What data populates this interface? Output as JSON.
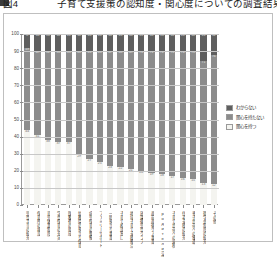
{
  "title": {
    "marker": "figure-bullet",
    "text": "図4　　　　子育て支援策の認知度・関心度についての調査結果（％）"
  },
  "legend": {
    "position": "right",
    "items": [
      {
        "label": "わからない",
        "color": "#5f5f5f"
      },
      {
        "label": "関心を持たない",
        "color": "#8c8c8c"
      },
      {
        "label": "関心を持つ",
        "color": "#f4f4f0"
      }
    ]
  },
  "axes": {
    "y_ticks": [
      "0",
      "10",
      "20",
      "30",
      "40",
      "50",
      "60",
      "70",
      "80",
      "90",
      "100"
    ],
    "y_min": 0,
    "y_max": 100,
    "y_step": 10,
    "grid": true
  },
  "colors": {
    "series_dark": "#5f5f5f",
    "series_mid": "#8c8c8c",
    "series_light": "#f4f4f0",
    "gridline": "#c8c8c8",
    "axis": "#9a9a9a",
    "frame": "#bfbfbf",
    "background": "#ffffff",
    "text": "#3a3a3a"
  },
  "chart_data": {
    "type": "bar",
    "stacked": true,
    "stack_total": 100,
    "orientation": "vertical",
    "xlabel": "",
    "ylabel": "",
    "ylim": [
      0,
      100
    ],
    "grid": true,
    "legend_position": "right",
    "categories": [
      "児童手当の拡充",
      "保育所の増設",
      "育児休業制度",
      "学童保育の充実",
      "医療費の助成",
      "幼稚園の預かり保育",
      "病児保育の整備",
      "ファミリーサポート",
      "一時預かり事業",
      "子育て相談窓口",
      "地域子育て支援拠点",
      "放課後児童クラブ",
      "産前産後ケア事業",
      "родители交流の場",
      "子育て世帯への減税",
      "住宅支援の拡充",
      "多子世帯への優遇",
      "奨学金制度の拡充",
      "その他"
    ],
    "series": [
      {
        "name": "関心を持つ",
        "color": "#f4f4f0",
        "values": [
          44,
          41,
          38,
          37,
          37,
          29,
          27,
          25,
          23,
          22,
          21,
          20,
          19,
          18,
          17,
          16,
          15,
          13,
          12
        ]
      },
      {
        "name": "関心を持たない",
        "color": "#8c8c8c",
        "values": [
          48,
          49,
          52,
          53,
          53,
          61,
          63,
          65,
          67,
          68,
          69,
          70,
          71,
          72,
          73,
          74,
          75,
          71,
          76
        ]
      },
      {
        "name": "わからない",
        "color": "#5f5f5f",
        "values": [
          8,
          10,
          10,
          10,
          10,
          10,
          10,
          10,
          10,
          10,
          10,
          10,
          10,
          10,
          10,
          10,
          10,
          16,
          12
        ]
      }
    ]
  }
}
